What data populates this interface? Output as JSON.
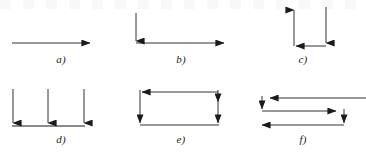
{
  "figure": {
    "kind": "line-arrow-diagram-set",
    "background_color": "#ffffff",
    "stroke_color": "#1b1b1b",
    "label_color": "#1b1b1b",
    "panel_count": 6,
    "panels": [
      {
        "id": "a",
        "label": "a)",
        "description": "single horizontal arrow pointing right",
        "segment_count": 1,
        "arrowhead_count": 1,
        "arrowhead_directions": [
          "right"
        ]
      },
      {
        "id": "b",
        "label": "b)",
        "description": "vertical arrow down then horizontal arrow right forming an L",
        "segment_count": 2,
        "arrowhead_count": 2,
        "arrowhead_directions": [
          "down",
          "right"
        ]
      },
      {
        "id": "c",
        "label": "c)",
        "description": "U shape: right side down, bottom leftward, left side up",
        "segment_count": 3,
        "arrowhead_count": 3,
        "arrowhead_directions": [
          "down",
          "left",
          "up"
        ]
      },
      {
        "id": "d",
        "label": "d)",
        "description": "three vertical arrows pointing down onto a shared horizontal baseline",
        "segment_count": 4,
        "arrowhead_count": 3,
        "arrowhead_directions": [
          "down",
          "down",
          "down"
        ]
      },
      {
        "id": "e",
        "label": "e)",
        "description": "closed rectangle circuit with four arrowheads",
        "segment_count": 4,
        "arrowhead_count": 4,
        "arrowhead_directions": [
          "left",
          "down",
          "down",
          "down"
        ]
      },
      {
        "id": "f",
        "label": "f)",
        "description": "serpentine path: top leftward, short drop, middle rightward, drop, bottom leftward",
        "segment_count": 5,
        "arrowhead_count": 5,
        "arrowhead_directions": [
          "left",
          "down",
          "right",
          "down",
          "left"
        ]
      }
    ]
  }
}
